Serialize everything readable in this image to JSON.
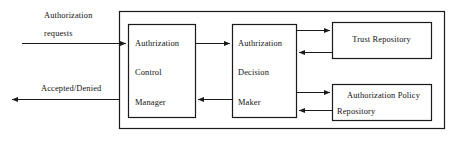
{
  "diagram": {
    "colors": {
      "stroke": "#1a1a1a",
      "background": "#ffffff",
      "text": "#111111"
    },
    "external_labels": [
      {
        "name": "authorization-requests-label",
        "line1": "Authorization",
        "line2": "requests"
      },
      {
        "name": "accepted-denied-label",
        "text": "Accepted/Denied"
      }
    ],
    "boxes": [
      {
        "name": "authorization-control-manager-box",
        "lines": [
          "Authrization",
          "Control",
          "Manager"
        ]
      },
      {
        "name": "authorization-decision-maker-box",
        "lines": [
          "Authrization",
          "Decision",
          "Maker"
        ]
      },
      {
        "name": "trust-repository-box",
        "lines": [
          "Trust Repository"
        ]
      },
      {
        "name": "authorization-policy-repository-box",
        "lines": [
          "Authorization  Policy",
          "Repository"
        ]
      }
    ],
    "connectors": [
      {
        "name": "requests-input-arrow",
        "direction": "right"
      },
      {
        "name": "accepted-denied-output-arrow",
        "direction": "left"
      },
      {
        "name": "control-to-decision-arrow",
        "direction": "right"
      },
      {
        "name": "decision-to-control-arrow",
        "direction": "left"
      },
      {
        "name": "decision-to-trust-arrow",
        "direction": "right"
      },
      {
        "name": "trust-to-decision-arrow",
        "direction": "left"
      },
      {
        "name": "decision-to-policy-arrow",
        "direction": "right"
      },
      {
        "name": "policy-to-decision-arrow",
        "direction": "left"
      }
    ]
  }
}
